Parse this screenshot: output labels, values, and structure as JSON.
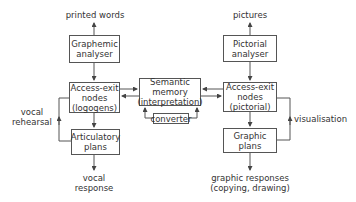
{
  "diagram": {
    "inputs": {
      "left": "printed words",
      "right": "pictures"
    },
    "boxes": {
      "graphemic": [
        "Graphemic",
        "analyser"
      ],
      "logogens": [
        "Access-exit",
        "nodes",
        "(logogens)"
      ],
      "articulatory": [
        "Articulatory",
        "plans"
      ],
      "semantic": [
        "Semantic",
        "memory",
        "(interpretation)"
      ],
      "converter": [
        "converter"
      ],
      "pictorial_analyser": [
        "Pictorial",
        "analyser"
      ],
      "pictorial_nodes": [
        "Access-exit",
        "nodes",
        "(pictorial)"
      ],
      "graphic_plans": [
        "Graphic",
        "plans"
      ]
    },
    "loops": {
      "left": [
        "vocal",
        "rehearsal"
      ],
      "right": "visualisation"
    },
    "outputs": {
      "left": [
        "vocal",
        "response"
      ],
      "right": [
        "graphic responses",
        "(copying, drawing)"
      ]
    },
    "line_color": "#555555"
  }
}
